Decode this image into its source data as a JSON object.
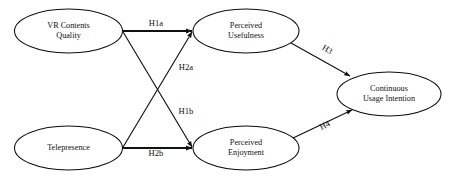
{
  "diagram": {
    "type": "research-model-path-diagram",
    "title": "",
    "background_color": "#ffffff",
    "line_color": "#111111",
    "node_fill": "#ffffff",
    "nodes": [
      {
        "id": "vr-contents-quality",
        "label_lines": [
          "VR Contents",
          "Quality"
        ],
        "cx": 68.5,
        "cy": 31,
        "rx": 54,
        "ry": 22
      },
      {
        "id": "telepresence",
        "label_lines": [
          "Telepresence"
        ],
        "cx": 68.5,
        "cy": 148,
        "rx": 54,
        "ry": 22
      },
      {
        "id": "perceived-usefulness",
        "label_lines": [
          "Perceived",
          "Usefulness"
        ],
        "cx": 246,
        "cy": 31,
        "rx": 53,
        "ry": 22
      },
      {
        "id": "perceived-enjoyment",
        "label_lines": [
          "Perceived",
          "Enjoyment"
        ],
        "cx": 246,
        "cy": 148,
        "rx": 53,
        "ry": 22
      },
      {
        "id": "continuous-usage-intention",
        "label_lines": [
          "Continuous",
          "Usage Intention"
        ],
        "cx": 389,
        "cy": 94,
        "rx": 52,
        "ry": 22
      }
    ],
    "edges": [
      {
        "id": "h1a",
        "label": "H1a",
        "from": "vr-contents-quality",
        "to": "perceived-usefulness",
        "x1": 122.5,
        "y1": 31,
        "x2": 192,
        "y2": 31,
        "label_x": 156,
        "label_y": 24,
        "label_rotation": 0,
        "weight": "thick"
      },
      {
        "id": "h2a",
        "label": "H2a",
        "from": "telepresence",
        "to": "perceived-usefulness",
        "x1": 122.5,
        "y1": 148,
        "x2": 192,
        "y2": 32,
        "label_x": 186,
        "label_y": 68,
        "label_rotation": 0,
        "weight": "thin"
      },
      {
        "id": "h1b",
        "label": "H1b",
        "from": "vr-contents-quality",
        "to": "perceived-enjoyment",
        "x1": 122.5,
        "y1": 31,
        "x2": 192,
        "y2": 147,
        "label_x": 186,
        "label_y": 112,
        "label_rotation": 0,
        "weight": "thin"
      },
      {
        "id": "h2b",
        "label": "H2b",
        "from": "telepresence",
        "to": "perceived-enjoyment",
        "x1": 122.5,
        "y1": 148,
        "x2": 192,
        "y2": 148,
        "label_x": 156,
        "label_y": 154,
        "label_rotation": 0,
        "weight": "thick"
      },
      {
        "id": "h3",
        "label": "H3",
        "from": "perceived-usefulness",
        "to": "continuous-usage-intention",
        "x1": 291,
        "y1": 43,
        "x2": 350,
        "y2": 76,
        "label_x": 327,
        "label_y": 50,
        "label_rotation": 29,
        "weight": "thin"
      },
      {
        "id": "h4",
        "label": "H4",
        "from": "perceived-enjoyment",
        "to": "continuous-usage-intention",
        "x1": 291,
        "y1": 139,
        "x2": 352,
        "y2": 110,
        "label_x": 325,
        "label_y": 126,
        "label_rotation": -26,
        "weight": "thin"
      }
    ]
  }
}
